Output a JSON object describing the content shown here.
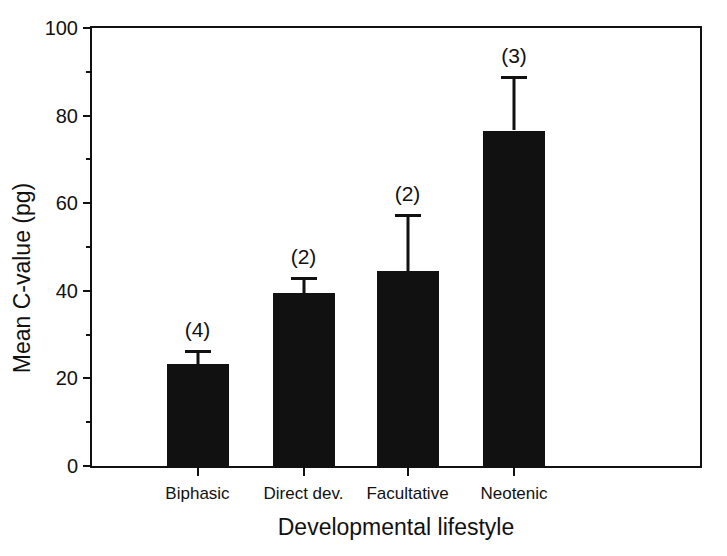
{
  "chart_data": {
    "type": "bar",
    "title": "",
    "subtitle": "",
    "xlabel": "Developmental lifestyle",
    "ylabel": "Mean C-value (pg)",
    "categories": [
      "Biphasic",
      "Direct dev.",
      "Facultative",
      "Neotenic"
    ],
    "values": [
      23.2,
      39.5,
      44.5,
      76.6
    ],
    "errors": [
      3.2,
      3.6,
      13.0,
      12.4
    ],
    "error_type": "upper-only",
    "annotations": [
      "(4)",
      "(2)",
      "(2)",
      "(3)"
    ],
    "annotation_meaning": "sample size n in parentheses",
    "ylim": [
      0,
      100
    ],
    "yticks": [
      0,
      20,
      40,
      60,
      80,
      100
    ],
    "ytick_labels": [
      "0",
      "20",
      "40",
      "60",
      "80",
      "100"
    ],
    "yminorticks": [
      10,
      30,
      50,
      70,
      90
    ],
    "grid": false,
    "legend": false,
    "bar_color": "#111111",
    "axis_color": "#111111",
    "background": "#ffffff"
  }
}
